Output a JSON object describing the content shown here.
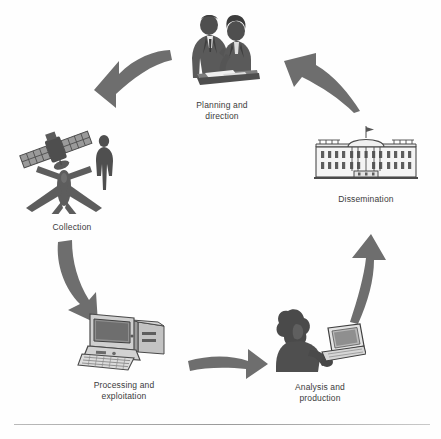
{
  "diagram": {
    "type": "cycle-diagram",
    "background_color": "#fefefe",
    "arrow_color": "#6e6e6e",
    "art_color": "#5d5d5d",
    "label_color": "#3b3b3b",
    "stage_count": 5,
    "stages": [
      {
        "id": "planning-and-direction",
        "label": "Planning and\ndirection",
        "icon": "two-people-meeting-icon",
        "position": "top-center"
      },
      {
        "id": "collection",
        "label": "Collection",
        "icon": "satellite-person-aircraft-icon",
        "position": "upper-left"
      },
      {
        "id": "processing-and-exploitation",
        "label": "Processing and\nexploitation",
        "icon": "desktop-computer-icon",
        "position": "lower-left"
      },
      {
        "id": "analysis-and-production",
        "label": "Analysis and\nproduction",
        "icon": "analyst-at-computer-icon",
        "position": "lower-right"
      },
      {
        "id": "dissemination",
        "label": "Dissemination",
        "icon": "white-house-icon",
        "position": "upper-right"
      }
    ],
    "arrows": [
      {
        "id": "arrow-planning-to-collection",
        "from": "planning-and-direction",
        "to": "collection",
        "shape": "curved-arrow-down-left"
      },
      {
        "id": "arrow-collection-to-processing",
        "from": "collection",
        "to": "processing-and-exploitation",
        "shape": "curved-arrow-down"
      },
      {
        "id": "arrow-processing-to-analysis",
        "from": "processing-and-exploitation",
        "to": "analysis-and-production",
        "shape": "curved-arrow-right"
      },
      {
        "id": "arrow-analysis-to-dissemination",
        "from": "analysis-and-production",
        "to": "dissemination",
        "shape": "curved-arrow-up"
      },
      {
        "id": "arrow-dissemination-to-planning",
        "from": "dissemination",
        "to": "planning-and-direction",
        "shape": "curved-arrow-up-left"
      }
    ],
    "footer_rule": true
  }
}
